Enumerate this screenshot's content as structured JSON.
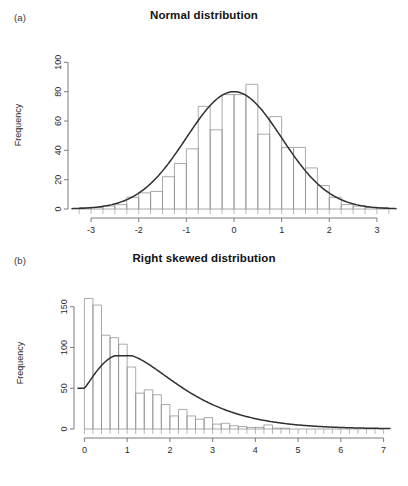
{
  "figure": {
    "background": "#ffffff",
    "axis_color": "#6d6d6d",
    "bar_stroke": "#8d8d8d",
    "curve_color": "#2f2f2f"
  },
  "panels": [
    {
      "key": "a",
      "label": "(a)",
      "title": "Normal distribution",
      "ylabel": "Frequency"
    },
    {
      "key": "b",
      "label": "(b)",
      "title": "Right skewed distribution",
      "ylabel": "Frequency"
    }
  ],
  "chart_data": [
    {
      "id": "normal-distribution",
      "type": "bar",
      "title": "Normal distribution",
      "subtitle": "(a)",
      "xlabel": "",
      "ylabel": "Frequency",
      "xlim": [
        -3.4,
        3.4
      ],
      "ylim": [
        0,
        105
      ],
      "xticks": [
        -3,
        -2,
        -1,
        0,
        1,
        2,
        3
      ],
      "xticklabels": [
        "-3",
        "-2",
        "-1",
        "0",
        "1",
        "2",
        "3"
      ],
      "yticks": [
        0,
        20,
        40,
        60,
        80,
        100
      ],
      "yticklabels": [
        "0",
        "20",
        "40",
        "60",
        "80",
        "100"
      ],
      "grid": false,
      "legend": null,
      "bin_width": 0.25,
      "bin_edges": [
        -3.25,
        -3.0,
        -2.75,
        -2.5,
        -2.25,
        -2.0,
        -1.75,
        -1.5,
        -1.25,
        -1.0,
        -0.75,
        -0.5,
        -0.25,
        0.0,
        0.25,
        0.5,
        0.75,
        1.0,
        1.25,
        1.5,
        1.75,
        2.0,
        2.25,
        2.5,
        2.75,
        3.0,
        3.25
      ],
      "bin_centers": [
        -3.125,
        -2.875,
        -2.625,
        -2.375,
        -2.125,
        -1.875,
        -1.625,
        -1.375,
        -1.125,
        -0.875,
        -0.625,
        -0.375,
        -0.125,
        0.125,
        0.375,
        0.625,
        0.875,
        1.125,
        1.375,
        1.625,
        1.875,
        2.125,
        2.375,
        2.625,
        2.875,
        3.125
      ],
      "values": [
        1,
        1,
        2,
        3,
        8,
        11,
        12,
        22,
        31,
        41,
        70,
        54,
        78,
        78,
        85,
        51,
        63,
        42,
        42,
        28,
        16,
        8,
        3,
        2,
        1,
        1
      ],
      "overlay_curve": {
        "name": "normal density",
        "kind": "line",
        "peak_x": 0,
        "peak_y": 80,
        "mean": 0,
        "sd": 1,
        "scale": 80
      }
    },
    {
      "id": "right-skewed-distribution",
      "type": "bar",
      "title": "Right skewed distribution",
      "subtitle": "(b)",
      "xlabel": "",
      "ylabel": "Frequency",
      "xlim": [
        -0.15,
        7.15
      ],
      "ylim": [
        0,
        168
      ],
      "xticks": [
        0,
        1,
        2,
        3,
        4,
        5,
        6,
        7
      ],
      "xticklabels": [
        "0",
        "1",
        "2",
        "3",
        "4",
        "5",
        "6",
        "7"
      ],
      "yticks": [
        0,
        50,
        100,
        150
      ],
      "yticklabels": [
        "0",
        "50",
        "100",
        "150"
      ],
      "grid": false,
      "legend": null,
      "bin_width": 0.2,
      "bin_edges": [
        0.0,
        0.2,
        0.4,
        0.6,
        0.8,
        1.0,
        1.2,
        1.4,
        1.6,
        1.8,
        2.0,
        2.2,
        2.4,
        2.6,
        2.8,
        3.0,
        3.2,
        3.4,
        3.6,
        3.8,
        4.0,
        4.2,
        4.4,
        4.6,
        4.8,
        5.0,
        5.2,
        5.4,
        5.6,
        5.8,
        6.0,
        6.2,
        6.4,
        6.6,
        6.8,
        7.0
      ],
      "bin_centers": [
        0.1,
        0.3,
        0.5,
        0.7,
        0.9,
        1.1,
        1.3,
        1.5,
        1.7,
        1.9,
        2.1,
        2.3,
        2.5,
        2.7,
        2.9,
        3.1,
        3.3,
        3.5,
        3.7,
        3.9,
        4.1,
        4.3,
        4.5,
        4.7,
        4.9,
        5.1,
        5.3,
        5.5,
        5.7,
        5.9,
        6.1,
        6.3,
        6.5,
        6.7,
        6.9
      ],
      "values": [
        160,
        152,
        115,
        112,
        104,
        76,
        44,
        48,
        42,
        30,
        16,
        24,
        16,
        12,
        14,
        6,
        7,
        4,
        3,
        2,
        2,
        5,
        1,
        1,
        0,
        0,
        0,
        0,
        0,
        0,
        0,
        0,
        0,
        0,
        0
      ],
      "overlay_curve": {
        "name": "skewed density",
        "kind": "line",
        "peak_x": 1.0,
        "peak_y": 88,
        "y_at_zero": 50,
        "scale": 88
      }
    }
  ]
}
